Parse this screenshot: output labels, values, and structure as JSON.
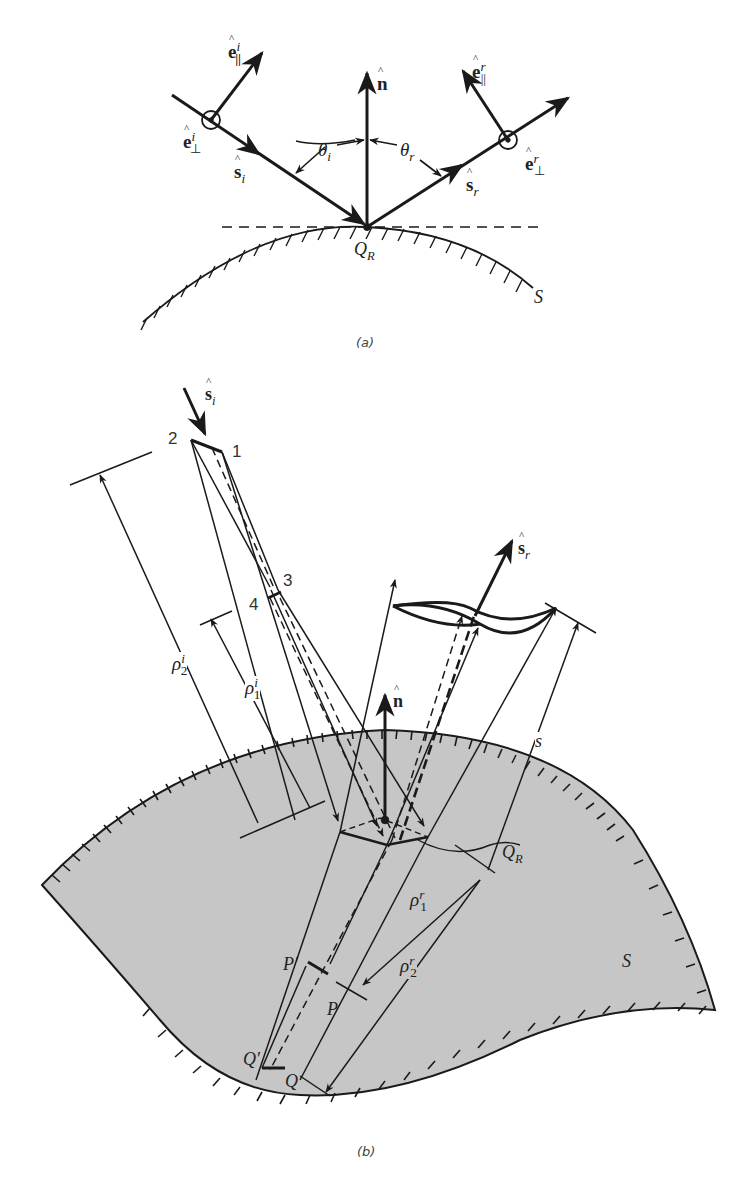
{
  "figure": {
    "panel_a": {
      "caption": "(a)",
      "labels": {
        "e_par_i": {
          "base": "e",
          "sub": "||",
          "sup": "i"
        },
        "e_perp_i": {
          "base": "e",
          "sub": "⊥",
          "sup": "i"
        },
        "s_i": {
          "base": "s",
          "sub": "i"
        },
        "n": {
          "base": "n"
        },
        "theta_i": {
          "base": "θ",
          "sub": "i"
        },
        "theta_r": {
          "base": "θ",
          "sub": "r"
        },
        "s_r": {
          "base": "s",
          "sub": "r"
        },
        "e_par_r": {
          "base": "e",
          "sub": "||",
          "sup": "r"
        },
        "e_perp_r": {
          "base": "e",
          "sub": "⊥",
          "sup": "r"
        },
        "Q_R": {
          "base": "Q",
          "sub": "R"
        },
        "S": "S"
      }
    },
    "panel_b": {
      "caption": "(b)",
      "labels": {
        "s_i": {
          "base": "s",
          "sub": "i"
        },
        "corner_1": "1",
        "corner_2": "2",
        "corner_3": "3",
        "corner_4": "4",
        "s_r": {
          "base": "s",
          "sub": "r"
        },
        "rho_2_i": {
          "base": "ρ",
          "sub": "2",
          "sup": "i"
        },
        "rho_1_i": {
          "base": "ρ",
          "sub": "1",
          "sup": "i"
        },
        "n": {
          "base": "n"
        },
        "s": "s",
        "Q_R": {
          "base": "Q",
          "sub": "R"
        },
        "rho_1_r": {
          "base": "ρ",
          "sub": "1",
          "sup": "r"
        },
        "rho_2_r": {
          "base": "ρ",
          "sub": "2",
          "sup": "r"
        },
        "P_prime": "P′",
        "P": "P",
        "Q_prime": "Q′",
        "Q": "Q",
        "S": "S"
      }
    }
  },
  "colors": {
    "ink": "#1a1a1a",
    "surface_fill": "#c8c8c8",
    "background": "#ffffff"
  }
}
